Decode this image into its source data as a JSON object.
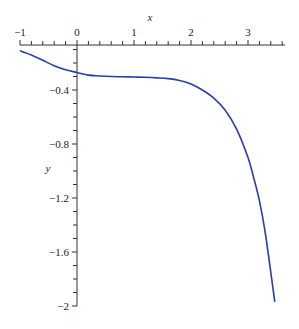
{
  "chart_data": {
    "type": "line",
    "title": "",
    "xlabel": "x",
    "ylabel": "y",
    "xlim": [
      -1.0,
      3.65
    ],
    "ylim": [
      -2.0,
      -0.067
    ],
    "grid": false,
    "legend": null,
    "x_ticks": {
      "major": [
        -1,
        0,
        1,
        2,
        3
      ],
      "labels": [
        "−1",
        "0",
        "1",
        "2",
        "3"
      ],
      "minor_step": 0.2
    },
    "y_ticks": {
      "major": [
        -0.4,
        -0.8,
        -1.2,
        -1.6,
        -2
      ],
      "labels": [
        "−0.4",
        "−0.8",
        "−1.2",
        "−1.6",
        "−2"
      ],
      "minor_step": 0.1
    },
    "series": [
      {
        "name": "curve",
        "color": "#2b3bb0",
        "points": [
          [
            -1.0,
            -0.11
          ],
          [
            -0.8,
            -0.14
          ],
          [
            -0.6,
            -0.18
          ],
          [
            -0.4,
            -0.22
          ],
          [
            -0.2,
            -0.25
          ],
          [
            0.0,
            -0.27
          ],
          [
            0.2,
            -0.29
          ],
          [
            0.4,
            -0.296
          ],
          [
            0.6,
            -0.3
          ],
          [
            0.8,
            -0.302
          ],
          [
            1.0,
            -0.304
          ],
          [
            1.2,
            -0.306
          ],
          [
            1.4,
            -0.31
          ],
          [
            1.6,
            -0.316
          ],
          [
            1.8,
            -0.33
          ],
          [
            2.0,
            -0.355
          ],
          [
            2.2,
            -0.4
          ],
          [
            2.4,
            -0.46
          ],
          [
            2.6,
            -0.55
          ],
          [
            2.8,
            -0.69
          ],
          [
            3.0,
            -0.9
          ],
          [
            3.1,
            -1.05
          ],
          [
            3.2,
            -1.22
          ],
          [
            3.3,
            -1.45
          ],
          [
            3.4,
            -1.75
          ],
          [
            3.47,
            -1.97
          ]
        ]
      }
    ]
  },
  "axes": {
    "x_title": "x",
    "y_title": "y"
  }
}
